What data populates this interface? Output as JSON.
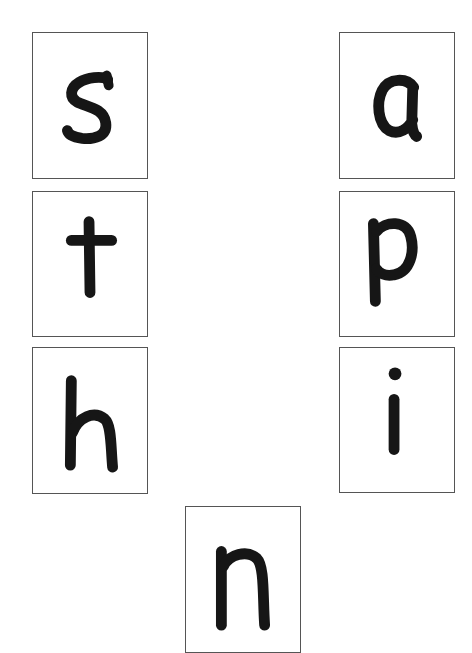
{
  "cards": [
    {
      "letter": "s",
      "position": "left-row-1"
    },
    {
      "letter": "a",
      "position": "right-row-1"
    },
    {
      "letter": "t",
      "position": "left-row-2"
    },
    {
      "letter": "p",
      "position": "right-row-2"
    },
    {
      "letter": "h",
      "position": "left-row-3"
    },
    {
      "letter": "i",
      "position": "right-row-3"
    },
    {
      "letter": "n",
      "position": "bottom-center-partial"
    }
  ],
  "colors": {
    "ink": "#161616",
    "border": "#555555",
    "background": "#ffffff"
  }
}
